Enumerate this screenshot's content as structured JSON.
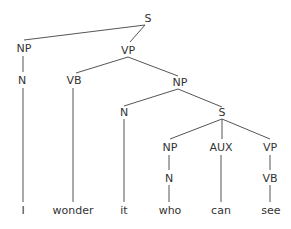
{
  "nodes": {
    "s_root": "S",
    "np1": "NP",
    "vp1": "VP",
    "n1": "N",
    "vb1": "VB",
    "np2": "NP",
    "n2": "N",
    "s2": "S",
    "np3": "NP",
    "aux": "AUX",
    "vp2": "VP",
    "n3": "N",
    "vb2": "VB"
  },
  "words": [
    "I",
    "wonder",
    "it",
    "who",
    "can",
    "see"
  ],
  "colors": {
    "line": "#555555",
    "text": "#333333"
  }
}
